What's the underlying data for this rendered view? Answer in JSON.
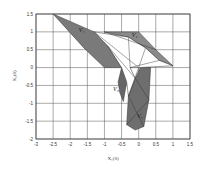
{
  "chart_data": {
    "type": "area",
    "title": "",
    "xlabel": "X1(0)",
    "ylabel": "X2(0)",
    "xlim": [
      -3,
      1.5
    ],
    "ylim": [
      -2,
      1.5
    ],
    "grid": true,
    "xticks": [
      "-3",
      "-2.5",
      "-2",
      "-1.5",
      "-1",
      "-0.5",
      "0",
      "0.5",
      "1",
      "1.5"
    ],
    "yticks": [
      "1.5",
      "1",
      "0.5",
      "0",
      "-0.5",
      "-1",
      "-1.5",
      "-2"
    ],
    "regions": [
      {
        "name": "V1",
        "label": "V₁",
        "shade": "#7a7a7a",
        "polygon": [
          [
            -2.5,
            1.5
          ],
          [
            -1.3,
            1.0
          ],
          [
            -0.9,
            0.6
          ],
          [
            -0.5,
            0.0
          ],
          [
            -1.0,
            0.0
          ],
          [
            -1.6,
            0.55
          ]
        ]
      },
      {
        "name": "V2",
        "label": "V₂",
        "shade": "#8a8a8a",
        "polygon": [
          [
            -1.0,
            1.0
          ],
          [
            0.0,
            1.0
          ],
          [
            0.5,
            0.5
          ],
          [
            1.0,
            0.05
          ],
          [
            0.6,
            0.2
          ],
          [
            0.2,
            0.55
          ],
          [
            -0.3,
            0.85
          ]
        ]
      },
      {
        "name": "V3",
        "label": "V₃",
        "shade": "#666666",
        "polygon": [
          [
            -0.5,
            0.0
          ],
          [
            -0.25,
            0.0
          ],
          [
            -0.35,
            -0.4
          ],
          [
            -0.45,
            -0.95
          ],
          [
            -0.55,
            -0.7
          ],
          [
            -0.6,
            -0.4
          ]
        ]
      },
      {
        "name": "V4",
        "label": "V₄",
        "shade": "#6e6e6e",
        "polygon": [
          [
            0.05,
            0.0
          ],
          [
            0.35,
            0.0
          ],
          [
            0.3,
            -0.9
          ],
          [
            0.15,
            -1.65
          ],
          [
            -0.1,
            -1.75
          ],
          [
            -0.35,
            -1.6
          ],
          [
            -0.3,
            -0.8
          ],
          [
            -0.1,
            -0.3
          ]
        ]
      },
      {
        "name": "white",
        "label": "",
        "shade": "#ffffff",
        "polygon": [
          [
            -1.3,
            1.0
          ],
          [
            -0.3,
            0.85
          ],
          [
            0.2,
            0.55
          ],
          [
            0.6,
            0.2
          ],
          [
            1.0,
            0.05
          ],
          [
            0.0,
            0.0
          ],
          [
            -0.25,
            0.0
          ],
          [
            -0.1,
            -0.3
          ],
          [
            -0.3,
            -0.8
          ],
          [
            -0.35,
            -0.4
          ],
          [
            -0.5,
            0.0
          ],
          [
            -0.9,
            0.6
          ]
        ]
      }
    ],
    "annotations": [
      {
        "text": "V₁",
        "x": -1.75,
        "y": 1.0
      },
      {
        "text": "V₂",
        "x": -0.2,
        "y": 0.85
      },
      {
        "text": "V₃",
        "x": -0.75,
        "y": -0.65
      },
      {
        "text": "V₄",
        "x": -0.05,
        "y": -1.4
      }
    ]
  },
  "axes": {
    "xlabel": "X₁(0)",
    "ylabel": "X₂(0)"
  }
}
